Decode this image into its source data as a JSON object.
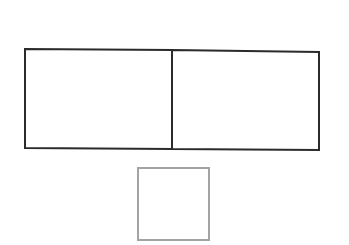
{
  "diagram": {
    "background": "#ffffff",
    "shapes": [
      {
        "id": "left-rectangle",
        "type": "polygon",
        "points": "25,49 172,50 172,149 25,148",
        "stroke": "#2b2b2b",
        "stroke_width": 2
      },
      {
        "id": "right-rectangle",
        "type": "polygon",
        "points": "172,50 319,52 319,150 172,149",
        "stroke": "#2b2b2b",
        "stroke_width": 2
      },
      {
        "id": "small-square",
        "type": "rect",
        "x": 138,
        "y": 168,
        "width": 71,
        "height": 72,
        "stroke": "#a3a3a3",
        "stroke_width": 2
      }
    ]
  }
}
